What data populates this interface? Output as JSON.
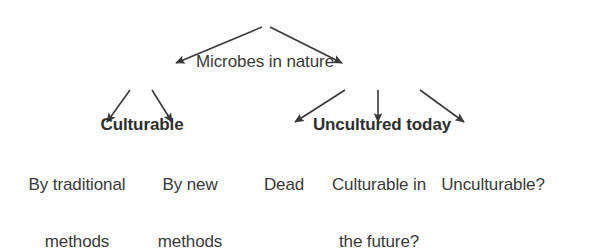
{
  "diagram": {
    "type": "hierarchy-tree",
    "title": "Microbes in nature",
    "colors": {
      "text": "#3a3a3a",
      "bold_text": "#2e2e2e",
      "arrow": "#3a3a3a",
      "background": "#ffffff"
    },
    "nodes": {
      "root": {
        "id": "microbes-in-nature",
        "label": "Microbes in nature",
        "lines": [
          "Microbes in nature"
        ],
        "level": 0,
        "emphasis": "normal",
        "x": 265,
        "y": 14
      },
      "level1": [
        {
          "id": "culturable",
          "label": "Culturable",
          "lines": [
            "Culturable"
          ],
          "level": 1,
          "emphasis": "bold",
          "x": 142,
          "y": 77
        },
        {
          "id": "uncultured-today",
          "label": "Uncultured today",
          "lines": [
            "Uncultured today"
          ],
          "level": 1,
          "emphasis": "bold",
          "x": 382,
          "y": 77
        }
      ],
      "level2": [
        {
          "id": "by-traditional-methods",
          "label": "By traditional methods",
          "lines": [
            "By traditional",
            "methods"
          ],
          "level": 2,
          "emphasis": "normal",
          "parent": "culturable",
          "x": 77,
          "y": 137
        },
        {
          "id": "by-new-methods",
          "label": "By new methods",
          "lines": [
            "By new",
            "methods"
          ],
          "level": 2,
          "emphasis": "normal",
          "parent": "culturable",
          "x": 190,
          "y": 137
        },
        {
          "id": "dead",
          "label": "Dead",
          "lines": [
            "Dead"
          ],
          "level": 2,
          "emphasis": "normal",
          "parent": "uncultured-today",
          "x": 284,
          "y": 137
        },
        {
          "id": "culturable-in-the-future",
          "label": "Culturable in the future?",
          "lines": [
            "Culturable in",
            "the future?"
          ],
          "level": 2,
          "emphasis": "normal",
          "parent": "uncultured-today",
          "x": 379,
          "y": 137
        },
        {
          "id": "unculturable",
          "label": "Unculturable?",
          "lines": [
            "Unculturable?"
          ],
          "level": 2,
          "emphasis": "normal",
          "parent": "uncultured-today",
          "x": 493,
          "y": 137
        }
      ]
    },
    "edges": [
      {
        "id": "root-to-culturable",
        "from": "microbes-in-nature",
        "to": "culturable",
        "x1": 262,
        "y1": 27,
        "x2": 176,
        "y2": 63
      },
      {
        "id": "root-to-uncultured",
        "from": "microbes-in-nature",
        "to": "uncultured-today",
        "x1": 270,
        "y1": 27,
        "x2": 342,
        "y2": 63
      },
      {
        "id": "culturable-to-traditional",
        "from": "culturable",
        "to": "by-traditional-methods",
        "x1": 130,
        "y1": 90,
        "x2": 107,
        "y2": 122
      },
      {
        "id": "culturable-to-new",
        "from": "culturable",
        "to": "by-new-methods",
        "x1": 152,
        "y1": 90,
        "x2": 172,
        "y2": 122
      },
      {
        "id": "uncultured-to-dead",
        "from": "uncultured-today",
        "to": "dead",
        "x1": 345,
        "y1": 90,
        "x2": 295,
        "y2": 122
      },
      {
        "id": "uncultured-to-future",
        "from": "uncultured-today",
        "to": "culturable-in-the-future",
        "x1": 378,
        "y1": 90,
        "x2": 378,
        "y2": 122
      },
      {
        "id": "uncultured-to-unculturable",
        "from": "uncultured-today",
        "to": "unculturable",
        "x1": 420,
        "y1": 90,
        "x2": 464,
        "y2": 122
      }
    ]
  }
}
